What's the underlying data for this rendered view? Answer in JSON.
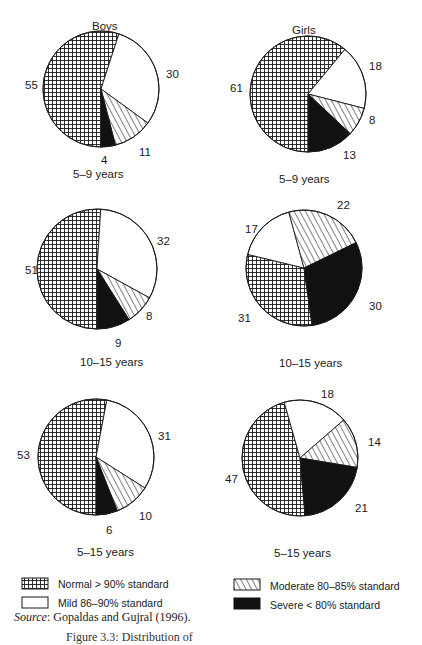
{
  "headers": {
    "boys": "Boys",
    "girls": "Girls"
  },
  "legend": [
    {
      "key": "normal",
      "label": "Normal > 90% standard",
      "pattern": "grid"
    },
    {
      "key": "mild",
      "label": "Mild 86–90% standard",
      "pattern": "white"
    },
    {
      "key": "moderate",
      "label": "Moderate 80–85% standard",
      "pattern": "hatch"
    },
    {
      "key": "severe",
      "label": "Severe < 80% standard",
      "pattern": "black"
    }
  ],
  "source": {
    "prefix": "Source",
    "text": ": Gopaldas and Gujral (1996)."
  },
  "figure_caption": "Figure 3.3: Distribution of",
  "chart_data": [
    {
      "type": "pie",
      "group": "Boys",
      "title": "5–9 years",
      "categories": [
        "Normal",
        "Mild",
        "Moderate",
        "Severe"
      ],
      "values": [
        55,
        30,
        11,
        4
      ]
    },
    {
      "type": "pie",
      "group": "Girls",
      "title": "5–9 years",
      "categories": [
        "Normal",
        "Mild",
        "Moderate",
        "Severe"
      ],
      "values": [
        61,
        18,
        8,
        13
      ]
    },
    {
      "type": "pie",
      "group": "Boys",
      "title": "10–15 years",
      "categories": [
        "Normal",
        "Mild",
        "Moderate",
        "Severe"
      ],
      "values": [
        51,
        32,
        8,
        9
      ]
    },
    {
      "type": "pie",
      "group": "Girls",
      "title": "10–15 years",
      "categories": [
        "Normal",
        "Mild",
        "Moderate",
        "Severe"
      ],
      "values": [
        31,
        17,
        22,
        30
      ]
    },
    {
      "type": "pie",
      "group": "Boys",
      "title": "5–15 years",
      "categories": [
        "Normal",
        "Mild",
        "Moderate",
        "Severe"
      ],
      "values": [
        53,
        31,
        10,
        6
      ]
    },
    {
      "type": "pie",
      "group": "Girls",
      "title": "5–15 years",
      "categories": [
        "Normal",
        "Mild",
        "Moderate",
        "Severe"
      ],
      "values": [
        47,
        18,
        14,
        21
      ]
    }
  ],
  "pies": [
    {
      "cx": 101,
      "cy": 89,
      "r": 58,
      "start": 180,
      "labels": [
        {
          "t": "55",
          "x": 25,
          "y": 79
        },
        {
          "t": "30",
          "x": 166,
          "y": 68
        },
        {
          "t": "11",
          "x": 139,
          "y": 146
        },
        {
          "t": "4",
          "x": 101,
          "y": 154
        }
      ],
      "caption": {
        "x": 73,
        "y": 168
      }
    },
    {
      "cx": 308,
      "cy": 94,
      "r": 58,
      "start": 180,
      "labels": [
        {
          "t": "61",
          "x": 230,
          "y": 82
        },
        {
          "t": "18",
          "x": 369,
          "y": 60
        },
        {
          "t": "8",
          "x": 369,
          "y": 114
        },
        {
          "t": "13",
          "x": 343,
          "y": 149
        }
      ],
      "caption": {
        "x": 279,
        "y": 173
      }
    },
    {
      "cx": 97,
      "cy": 269,
      "r": 60,
      "start": 180,
      "labels": [
        {
          "t": "51",
          "x": 25,
          "y": 264
        },
        {
          "t": "32",
          "x": 157,
          "y": 235
        },
        {
          "t": "8",
          "x": 146,
          "y": 310
        },
        {
          "t": "9",
          "x": 115,
          "y": 337
        }
      ],
      "caption": {
        "x": 80,
        "y": 356
      }
    },
    {
      "cx": 304,
      "cy": 268,
      "r": 58,
      "start": 172,
      "labels": [
        {
          "t": "22",
          "x": 337,
          "y": 199
        },
        {
          "t": "17",
          "x": 245,
          "y": 223
        },
        {
          "t": "30",
          "x": 369,
          "y": 300
        },
        {
          "t": "31",
          "x": 238,
          "y": 312
        }
      ],
      "caption": {
        "x": 279,
        "y": 357
      }
    },
    {
      "cx": 96,
      "cy": 457,
      "r": 58,
      "start": 180,
      "labels": [
        {
          "t": "53",
          "x": 17,
          "y": 449
        },
        {
          "t": "31",
          "x": 158,
          "y": 430
        },
        {
          "t": "10",
          "x": 139,
          "y": 510
        },
        {
          "t": "6",
          "x": 106,
          "y": 524
        }
      ],
      "caption": {
        "x": 77,
        "y": 546
      }
    },
    {
      "cx": 300,
      "cy": 458,
      "r": 58,
      "start": 175,
      "labels": [
        {
          "t": "18",
          "x": 321,
          "y": 388
        },
        {
          "t": "14",
          "x": 368,
          "y": 436
        },
        {
          "t": "47",
          "x": 225,
          "y": 473
        },
        {
          "t": "21",
          "x": 355,
          "y": 502
        }
      ],
      "caption": {
        "x": 274,
        "y": 547
      }
    }
  ],
  "colors": {
    "ink": "#1a1a1a",
    "paper": "#ffffff"
  }
}
